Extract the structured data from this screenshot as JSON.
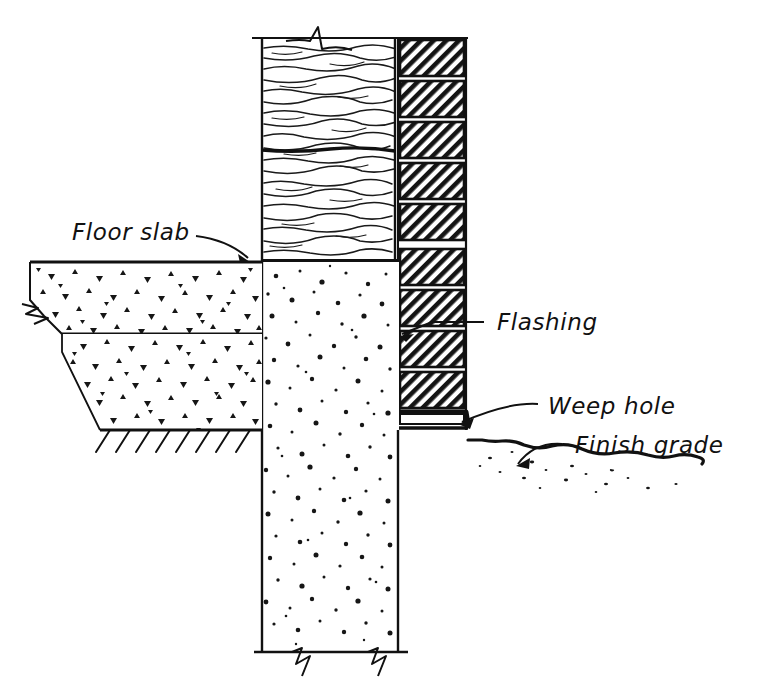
{
  "drawing": {
    "type": "architectural-section-detail",
    "subject": "Brick veneer wall at foundation / floor slab",
    "canvas": {
      "width": 762,
      "height": 695
    },
    "ink_color": "#111111",
    "paper_color": "#ffffff",
    "style": "hand-drawn pen-and-ink section"
  },
  "labels": {
    "floor_slab": "Floor slab",
    "flashing": "Flashing",
    "weep_hole": "Weep hole",
    "finish_grade": "Finish grade"
  },
  "label_positions": {
    "floor_slab": {
      "x": 72,
      "y": 240,
      "leader_from": [
        196,
        236
      ],
      "leader_to": [
        250,
        262
      ]
    },
    "flashing": {
      "x": 497,
      "y": 327,
      "leader_from": [
        478,
        320
      ],
      "leader_to": [
        404,
        330
      ]
    },
    "weep_hole": {
      "x": 548,
      "y": 412,
      "leader_from": [
        536,
        405
      ],
      "leader_to": [
        455,
        425
      ]
    },
    "finish_grade": {
      "x": 575,
      "y": 450,
      "leader_from": [
        556,
        444
      ],
      "leader_to": [
        528,
        467
      ]
    }
  },
  "components": [
    {
      "name": "wall-above-grade",
      "material": "concrete-masonry-unit",
      "hatch": "wood-grain-wavy",
      "x": 262,
      "y": 38,
      "width": 133,
      "height": 224
    },
    {
      "name": "brick-veneer",
      "material": "brick",
      "hatch": "diagonal-45",
      "x": 396,
      "y": 38,
      "width": 72,
      "height": 392,
      "course_count": 10,
      "course_height": 41,
      "mortar_joint": 5
    },
    {
      "name": "foundation-wall",
      "material": "cast-concrete",
      "hatch": "stipple-dots",
      "x": 262,
      "y": 262,
      "width": 137,
      "height": 390
    },
    {
      "name": "floor-slab",
      "material": "concrete-slab",
      "hatch": "triangular-aggregate",
      "x": 30,
      "y": 262,
      "width": 232,
      "height": 72
    },
    {
      "name": "gravel-fill",
      "material": "gravel",
      "hatch": "triangular-aggregate",
      "x": 62,
      "y": 334,
      "width": 200,
      "height": 96
    },
    {
      "name": "earth-hatch",
      "material": "undisturbed-earth",
      "hatch": "diagonal-ticks",
      "x": 100,
      "y": 430,
      "width": 162
    },
    {
      "name": "flashing-membrane",
      "material": "sheet-metal-flashing",
      "path": "cavity-up-then-out-under-brick"
    },
    {
      "name": "finish-grade-line",
      "material": "soil-surface",
      "x_start": 468,
      "y_start": 440,
      "x_end": 690,
      "y_end": 488
    }
  ],
  "break_symbols": [
    {
      "name": "break-top-wall",
      "x": 320,
      "y": 38,
      "orientation": "horizontal"
    },
    {
      "name": "break-left-slab",
      "x": 32,
      "y": 308,
      "orientation": "vertical"
    },
    {
      "name": "break-bottom-left",
      "x": 308,
      "y": 652,
      "orientation": "horizontal"
    },
    {
      "name": "break-bottom-right",
      "x": 382,
      "y": 652,
      "orientation": "horizontal"
    }
  ]
}
